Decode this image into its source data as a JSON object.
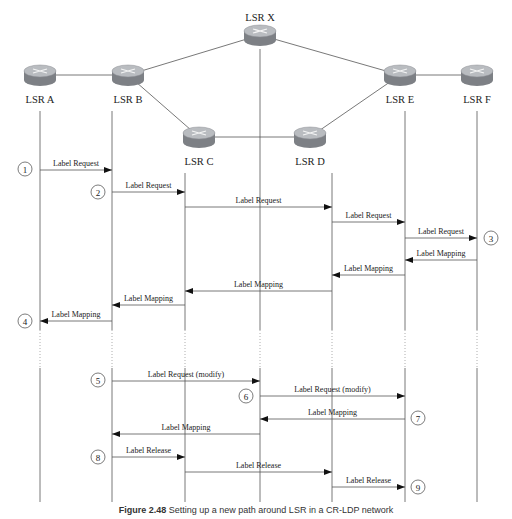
{
  "figure": {
    "caption_label": "Figure 2.48",
    "caption_text": "Setting up a new path around LSR in a CR-LDP network",
    "colors": {
      "line": "#555555",
      "arrow": "#111111",
      "router_top": "#b9bcc0",
      "router_side": "#7d8085"
    }
  },
  "nodes": [
    {
      "id": "A",
      "label": "LSR A",
      "x": 40,
      "y": 75,
      "lifeline_x": 40,
      "label_y": 103
    },
    {
      "id": "B",
      "label": "LSR B",
      "x": 128,
      "y": 75,
      "lifeline_x": 112,
      "label_y": 103
    },
    {
      "id": "X",
      "label": "LSR X",
      "x": 260,
      "y": 35,
      "lifeline_x": 260,
      "label_y": 21
    },
    {
      "id": "C",
      "label": "LSR C",
      "x": 199,
      "y": 137,
      "lifeline_x": 185,
      "label_y": 165
    },
    {
      "id": "D",
      "label": "LSR D",
      "x": 310,
      "y": 137,
      "lifeline_x": 332,
      "label_y": 165
    },
    {
      "id": "E",
      "label": "LSR E",
      "x": 400,
      "y": 75,
      "lifeline_x": 405,
      "label_y": 103
    },
    {
      "id": "F",
      "label": "LSR F",
      "x": 477,
      "y": 75,
      "lifeline_x": 477,
      "label_y": 103
    }
  ],
  "links": [
    [
      "A",
      "B"
    ],
    [
      "B",
      "X"
    ],
    [
      "B",
      "C"
    ],
    [
      "C",
      "D"
    ],
    [
      "X",
      "E"
    ],
    [
      "D",
      "E"
    ],
    [
      "E",
      "F"
    ]
  ],
  "messages": [
    {
      "label": "Label Request",
      "from": "A",
      "to": "B",
      "y": 170
    },
    {
      "label": "Label Request",
      "from": "B",
      "to": "C",
      "y": 192
    },
    {
      "label": "Label Request",
      "from": "C",
      "to": "D",
      "y": 207
    },
    {
      "label": "Label Request",
      "from": "D",
      "to": "E",
      "y": 222
    },
    {
      "label": "Label Request",
      "from": "E",
      "to": "F",
      "y": 238
    },
    {
      "label": "Label Mapping",
      "from": "F",
      "to": "E",
      "y": 260
    },
    {
      "label": "Label Mapping",
      "from": "E",
      "to": "D",
      "y": 275
    },
    {
      "label": "Label Mapping",
      "from": "D",
      "to": "C",
      "y": 291
    },
    {
      "label": "Label Mapping",
      "from": "C",
      "to": "B",
      "y": 305
    },
    {
      "label": "Label Mapping",
      "from": "B",
      "to": "A",
      "y": 321
    },
    {
      "label": "Label Request (modify)",
      "from": "B",
      "to": "X",
      "y": 381
    },
    {
      "label": "Label Request (modify)",
      "from": "X",
      "to": "E",
      "y": 396
    },
    {
      "label": "Label Mapping",
      "from": "E",
      "to": "X",
      "y": 419
    },
    {
      "label": "Label Mapping",
      "from": "X",
      "to": "B",
      "y": 434
    },
    {
      "label": "Label Release",
      "from": "B",
      "to": "C",
      "y": 457
    },
    {
      "label": "Label Release",
      "from": "C",
      "to": "D",
      "y": 472
    },
    {
      "label": "Label Release",
      "from": "D",
      "to": "E",
      "y": 487
    }
  ],
  "steps": [
    {
      "n": "1",
      "x": 25,
      "y": 169
    },
    {
      "n": "2",
      "x": 98,
      "y": 192
    },
    {
      "n": "3",
      "x": 491,
      "y": 238
    },
    {
      "n": "4",
      "x": 25,
      "y": 321
    },
    {
      "n": "5",
      "x": 98,
      "y": 380
    },
    {
      "n": "6",
      "x": 246,
      "y": 396
    },
    {
      "n": "7",
      "x": 418,
      "y": 418
    },
    {
      "n": "8",
      "x": 98,
      "y": 457
    },
    {
      "n": "9",
      "x": 418,
      "y": 487
    }
  ],
  "lifelines": {
    "gap_start": 330,
    "gap_end": 368,
    "end_y": 502
  }
}
